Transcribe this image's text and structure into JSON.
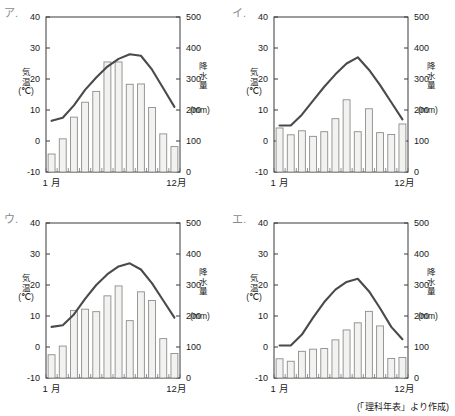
{
  "figure": {
    "source_note": "(「理科年表」より作成)",
    "axis": {
      "left_title_chars": [
        "気",
        "温"
      ],
      "left_unit": "(℃)",
      "right_title_chars": [
        "降",
        "水",
        "量"
      ],
      "right_unit": "(mm)",
      "temp_ticks": [
        "40",
        "30",
        "20",
        "10",
        "0",
        "-10"
      ],
      "temp_tick_values": [
        40,
        30,
        20,
        10,
        0,
        -10
      ],
      "precip_ticks": [
        "500",
        "400",
        "300",
        "200",
        "100",
        "0"
      ],
      "precip_tick_values": [
        500,
        400,
        300,
        200,
        100,
        0
      ],
      "month_start_label": "1 月",
      "month_end_label": "12月"
    }
  },
  "chart_data": [
    {
      "type": "bar",
      "panel_label": "ア.",
      "title": "",
      "xlabel": "",
      "ylabel": "気温(℃)",
      "y2label": "降水量(mm)",
      "categories": [
        "1",
        "2",
        "3",
        "4",
        "5",
        "6",
        "7",
        "8",
        "9",
        "10",
        "11",
        "12"
      ],
      "grid": false,
      "ylim": [
        -10,
        40
      ],
      "y2lim": [
        0,
        500
      ],
      "series": [
        {
          "name": "降水量",
          "unit": "mm",
          "kind": "bar",
          "axis": "right",
          "values": [
            58,
            107,
            177,
            225,
            260,
            355,
            355,
            283,
            284,
            208,
            123,
            82
          ]
        },
        {
          "name": "気温",
          "unit": "℃",
          "kind": "line",
          "axis": "left",
          "values": [
            6.5,
            7.5,
            11.5,
            16.5,
            20.5,
            24.0,
            26.5,
            28.0,
            27.5,
            23.0,
            17.0,
            11.0
          ]
        }
      ]
    },
    {
      "type": "bar",
      "panel_label": "イ.",
      "title": "",
      "xlabel": "",
      "ylabel": "気温(℃)",
      "y2label": "降水量(mm)",
      "categories": [
        "1",
        "2",
        "3",
        "4",
        "5",
        "6",
        "7",
        "8",
        "9",
        "10",
        "11",
        "12"
      ],
      "grid": false,
      "ylim": [
        -10,
        40
      ],
      "y2lim": [
        0,
        500
      ],
      "series": [
        {
          "name": "降水量",
          "unit": "mm",
          "kind": "bar",
          "axis": "right",
          "values": [
            142,
            120,
            133,
            115,
            130,
            172,
            233,
            130,
            204,
            127,
            121,
            155
          ]
        },
        {
          "name": "気温",
          "unit": "℃",
          "kind": "line",
          "axis": "left",
          "values": [
            5.0,
            5.0,
            8.5,
            13.0,
            17.5,
            21.5,
            25.0,
            27.0,
            23.0,
            18.0,
            12.5,
            7.0
          ]
        }
      ]
    },
    {
      "type": "bar",
      "panel_label": "ウ.",
      "title": "",
      "xlabel": "",
      "ylabel": "気温(℃)",
      "y2label": "降水量(mm)",
      "categories": [
        "1",
        "2",
        "3",
        "4",
        "5",
        "6",
        "7",
        "8",
        "9",
        "10",
        "11",
        "12"
      ],
      "grid": false,
      "ylim": [
        -10,
        40
      ],
      "y2lim": [
        0,
        500
      ],
      "series": [
        {
          "name": "降水量",
          "unit": "mm",
          "kind": "bar",
          "axis": "right",
          "values": [
            75,
            103,
            218,
            222,
            214,
            265,
            297,
            185,
            278,
            250,
            127,
            79
          ]
        },
        {
          "name": "気温",
          "unit": "℃",
          "kind": "line",
          "axis": "left",
          "values": [
            6.5,
            7.0,
            10.5,
            15.5,
            20.0,
            23.5,
            26.0,
            27.0,
            25.0,
            20.5,
            15.0,
            9.5
          ]
        }
      ]
    },
    {
      "type": "bar",
      "panel_label": "エ.",
      "title": "",
      "xlabel": "",
      "ylabel": "気温(℃)",
      "y2label": "降水量(mm)",
      "categories": [
        "1",
        "2",
        "3",
        "4",
        "5",
        "6",
        "7",
        "8",
        "9",
        "10",
        "11",
        "12"
      ],
      "grid": false,
      "ylim": [
        -10,
        40
      ],
      "y2lim": [
        0,
        500
      ],
      "series": [
        {
          "name": "降水量",
          "unit": "mm",
          "kind": "bar",
          "axis": "right",
          "values": [
            62,
            54,
            86,
            93,
            95,
            123,
            155,
            178,
            215,
            168,
            63,
            66
          ]
        },
        {
          "name": "気温",
          "unit": "℃",
          "kind": "line",
          "axis": "left",
          "values": [
            0.5,
            0.5,
            4.0,
            9.5,
            14.5,
            18.5,
            21.0,
            22.0,
            18.0,
            12.5,
            6.5,
            2.5
          ]
        }
      ]
    }
  ]
}
